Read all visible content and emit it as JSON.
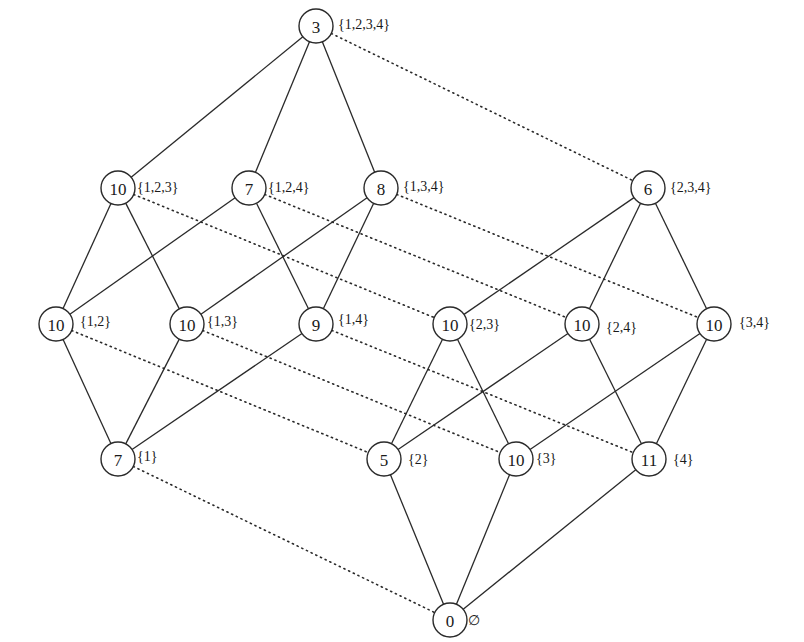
{
  "diagram": {
    "title": "",
    "node_radius": 17,
    "colors": {
      "stroke": "#2a2a2a",
      "text": "#1a1a1a",
      "background": "#ffffff"
    },
    "nodes": [
      {
        "id": "s1234",
        "value": "3",
        "label": "{1,2,3,4}",
        "x": 316,
        "y": 26,
        "lx": 22,
        "ly": -2
      },
      {
        "id": "s123",
        "value": "10",
        "label": "{1,2,3}",
        "x": 118,
        "y": 188,
        "lx": 19,
        "ly": -1
      },
      {
        "id": "s124",
        "value": "7",
        "label": "{1,2,4}",
        "x": 249,
        "y": 188,
        "lx": 19,
        "ly": -1
      },
      {
        "id": "s134",
        "value": "8",
        "label": "{1,3,4}",
        "x": 381,
        "y": 188,
        "lx": 22,
        "ly": -2
      },
      {
        "id": "s234",
        "value": "6",
        "label": "{2,3,4}",
        "x": 648,
        "y": 188,
        "lx": 22,
        "ly": -1
      },
      {
        "id": "s12",
        "value": "10",
        "label": "{1,2}",
        "x": 56,
        "y": 324,
        "lx": 24,
        "ly": -3
      },
      {
        "id": "s13",
        "value": "10",
        "label": "{1,3}",
        "x": 187,
        "y": 324,
        "lx": 20,
        "ly": -3
      },
      {
        "id": "s14",
        "value": "9",
        "label": "{1,4}",
        "x": 316,
        "y": 324,
        "lx": 22,
        "ly": -5
      },
      {
        "id": "s23",
        "value": "10",
        "label": "{2,3}",
        "x": 450,
        "y": 324,
        "lx": 19,
        "ly": 0
      },
      {
        "id": "s24",
        "value": "10",
        "label": "{2,4}",
        "x": 582,
        "y": 324,
        "lx": 24,
        "ly": 3
      },
      {
        "id": "s34",
        "value": "10",
        "label": "{3,4}",
        "x": 714,
        "y": 324,
        "lx": 25,
        "ly": -2
      },
      {
        "id": "s1",
        "value": "7",
        "label": "{1}",
        "x": 118,
        "y": 459,
        "lx": 19,
        "ly": -3
      },
      {
        "id": "s2",
        "value": "5",
        "label": "{2}",
        "x": 384,
        "y": 459,
        "lx": 24,
        "ly": 0
      },
      {
        "id": "s3",
        "value": "10",
        "label": "{3}",
        "x": 516,
        "y": 459,
        "lx": 20,
        "ly": -1
      },
      {
        "id": "s4",
        "value": "11",
        "label": "{4}",
        "x": 649,
        "y": 459,
        "lx": 24,
        "ly": 0
      },
      {
        "id": "s0",
        "value": "0",
        "label": "∅",
        "x": 450,
        "y": 620,
        "lx": 18,
        "ly": 0
      }
    ],
    "edges": [
      {
        "from": "s1234",
        "to": "s123",
        "style": "solid"
      },
      {
        "from": "s1234",
        "to": "s124",
        "style": "solid"
      },
      {
        "from": "s1234",
        "to": "s134",
        "style": "solid"
      },
      {
        "from": "s1234",
        "to": "s234",
        "style": "dotted"
      },
      {
        "from": "s123",
        "to": "s12",
        "style": "solid"
      },
      {
        "from": "s123",
        "to": "s13",
        "style": "solid"
      },
      {
        "from": "s124",
        "to": "s12",
        "style": "solid"
      },
      {
        "from": "s124",
        "to": "s14",
        "style": "solid"
      },
      {
        "from": "s134",
        "to": "s13",
        "style": "solid"
      },
      {
        "from": "s134",
        "to": "s14",
        "style": "solid"
      },
      {
        "from": "s123",
        "to": "s23",
        "style": "dotted"
      },
      {
        "from": "s124",
        "to": "s24",
        "style": "dotted"
      },
      {
        "from": "s134",
        "to": "s34",
        "style": "dotted"
      },
      {
        "from": "s234",
        "to": "s23",
        "style": "solid"
      },
      {
        "from": "s234",
        "to": "s24",
        "style": "solid"
      },
      {
        "from": "s234",
        "to": "s34",
        "style": "solid"
      },
      {
        "from": "s12",
        "to": "s1",
        "style": "solid"
      },
      {
        "from": "s13",
        "to": "s1",
        "style": "solid"
      },
      {
        "from": "s14",
        "to": "s1",
        "style": "solid"
      },
      {
        "from": "s12",
        "to": "s2",
        "style": "dotted"
      },
      {
        "from": "s13",
        "to": "s3",
        "style": "dotted"
      },
      {
        "from": "s14",
        "to": "s4",
        "style": "dotted"
      },
      {
        "from": "s23",
        "to": "s2",
        "style": "solid"
      },
      {
        "from": "s23",
        "to": "s3",
        "style": "solid"
      },
      {
        "from": "s24",
        "to": "s2",
        "style": "solid"
      },
      {
        "from": "s24",
        "to": "s4",
        "style": "solid"
      },
      {
        "from": "s34",
        "to": "s3",
        "style": "solid"
      },
      {
        "from": "s34",
        "to": "s4",
        "style": "solid"
      },
      {
        "from": "s1",
        "to": "s0",
        "style": "dotted"
      },
      {
        "from": "s2",
        "to": "s0",
        "style": "solid"
      },
      {
        "from": "s3",
        "to": "s0",
        "style": "solid"
      },
      {
        "from": "s4",
        "to": "s0",
        "style": "solid"
      }
    ]
  }
}
